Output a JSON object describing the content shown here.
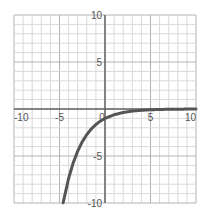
{
  "chart_data": {
    "type": "line",
    "title": "",
    "xlabel": "",
    "ylabel": "",
    "xlim": [
      -10,
      10
    ],
    "ylim": [
      -10,
      10
    ],
    "grid": true,
    "grid_minor_step": 1,
    "grid_major_step": 5,
    "x_ticks": [
      -10,
      -5,
      0,
      5,
      10
    ],
    "x_tick_labels": [
      "-10",
      "-5",
      "0",
      "5",
      "10"
    ],
    "y_ticks": [
      10,
      5,
      -5,
      -10
    ],
    "y_tick_labels": [
      "10",
      "5",
      "-5",
      "-10"
    ],
    "series": [
      {
        "name": "y = -e^(-x/2)",
        "color": "#555555",
        "x": [
          -4.6,
          -4,
          -3.5,
          -3,
          -2.5,
          -2,
          -1.5,
          -1,
          -0.5,
          0,
          1,
          2,
          3,
          4,
          5,
          6,
          7,
          8,
          9,
          10
        ],
        "y": [
          -9.97,
          -7.39,
          -5.75,
          -4.48,
          -3.49,
          -2.72,
          -2.12,
          -1.65,
          -1.28,
          -1.0,
          -0.61,
          -0.37,
          -0.22,
          -0.14,
          -0.08,
          -0.05,
          -0.03,
          -0.02,
          -0.01,
          -0.01
        ]
      }
    ],
    "legend": "none"
  },
  "colors": {
    "grid_minor": "#d9d9d9",
    "grid_major": "#b3b3b3",
    "axis": "#666666",
    "curve": "#555555",
    "label": "#555555"
  }
}
